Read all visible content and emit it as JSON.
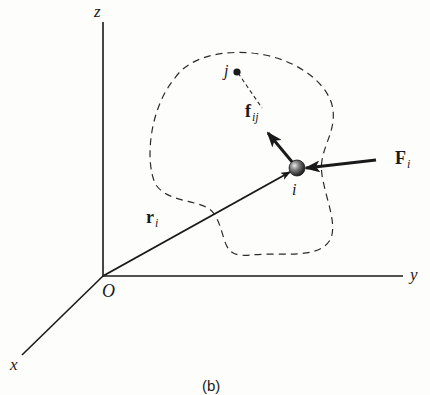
{
  "figure": {
    "caption": "(b)",
    "axes": {
      "z_label": "z",
      "y_label": "y",
      "x_label": "x",
      "origin_label": "O"
    },
    "vectors": {
      "position": {
        "symbol": "r",
        "subscript": "i"
      },
      "internal_force": {
        "symbol": "f",
        "subscript": "ij"
      },
      "external_force": {
        "symbol": "F",
        "subscript": "i"
      }
    },
    "points": {
      "particle_i": "i",
      "particle_j": "j"
    },
    "colors": {
      "ink": "#1a1a1a",
      "background": "#fdfdfb"
    }
  }
}
